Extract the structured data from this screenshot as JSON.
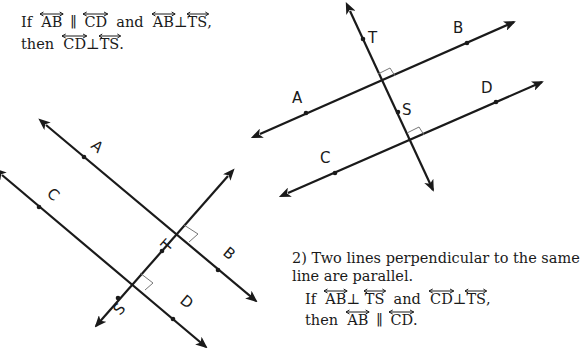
{
  "statement_1": {
    "line1": {
      "prefix": "If",
      "l1": "AB",
      "rel1": "∥",
      "l2": "CD",
      "conj": "and",
      "l3": "AB",
      "rel2": "⊥",
      "l4": "TS",
      "suffix": ","
    },
    "line2": {
      "prefix": "then",
      "l1": "CD",
      "rel": "⊥",
      "l2": "TS",
      "suffix": "."
    }
  },
  "statement_2": {
    "number": "2)",
    "text_line1": "Two lines perpendicular to the same",
    "text_line2": "line are parallel.",
    "line1": {
      "prefix": "If",
      "l1": "AB",
      "rel1": "⊥",
      "l2": "TS",
      "conj": "and",
      "l3": "CD",
      "rel2": "⊥",
      "l4": "TS",
      "suffix": ","
    },
    "line2": {
      "prefix": "then",
      "l1": "AB",
      "rel": "∥",
      "l2": "CD",
      "suffix": "."
    }
  },
  "figure_right": {
    "labels": {
      "A": "A",
      "B": "B",
      "C": "C",
      "D": "D",
      "T": "T",
      "S": "S"
    }
  },
  "figure_left": {
    "labels": {
      "A": "A",
      "B": "B",
      "C": "C",
      "D": "D",
      "T": "T",
      "S": "S"
    }
  },
  "colors": {
    "ink": "#1a1a1a",
    "right_angle_mark": "#777777",
    "background": "#ffffff"
  }
}
